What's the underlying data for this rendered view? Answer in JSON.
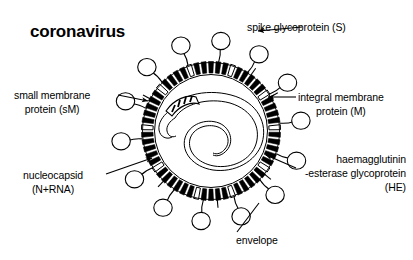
{
  "figure": {
    "title": "coronavirus",
    "background_color": "#ffffff",
    "stroke_color": "#000000"
  },
  "labels": {
    "spike": {
      "line1": "spike glycoprotein (S)"
    },
    "membrane_integral": {
      "line1": "integral membrane",
      "line2": "protein (M)"
    },
    "small_membrane": {
      "line1": "small membrane",
      "line2": "protein (sM)"
    },
    "nucleocapsid": {
      "line1": "nucleocapsid",
      "line2": "(N+RNA)"
    },
    "haemagglutinin": {
      "line1": "haemagglutinin",
      "line2": "-esterase glycoprotein",
      "line3": "(HE)"
    },
    "envelope": {
      "line1": "envelope"
    }
  },
  "diagram": {
    "center_x": 211,
    "center_y": 131,
    "envelope_outer_radius": 68,
    "envelope_inner_radius": 57,
    "spike_count": 14,
    "membrane_bar_count": 58,
    "nucleocapsid_coils": 3,
    "icons": {
      "spike": "lollipop-projection",
      "membrane_protein": "solid-radial-bar",
      "small_membrane_protein": "outlined-radial-bar",
      "nucleocapsid": "coiled-helical-ribbon"
    }
  }
}
